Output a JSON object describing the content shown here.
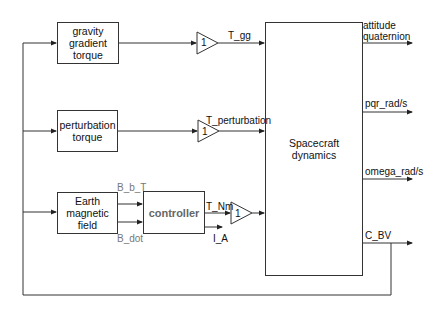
{
  "diagram": {
    "type": "block-diagram",
    "blocks": {
      "gravity": {
        "label": "gravity\ngradient\ntorque"
      },
      "perturbation": {
        "label": "perturbation\ntorque"
      },
      "earth": {
        "label": "Earth\nmagnetic\nfield"
      },
      "controller": {
        "label": "controller"
      },
      "dynamics": {
        "label": "Spacecraft dynamics"
      }
    },
    "gains": [
      {
        "value": "1"
      },
      {
        "value": "1"
      },
      {
        "value": "1"
      }
    ],
    "signals": {
      "t_gg": "T_gg",
      "t_perturbation": "T_perturbation",
      "b_b_t": "B_b_T",
      "b_dot": "B_dot",
      "t_nm": "T_Nm",
      "i_a": "I_A"
    },
    "outputs": [
      {
        "label": "attitude\nquaternion"
      },
      {
        "label": "pqr_rad/s"
      },
      {
        "label": "omega_rad/s"
      },
      {
        "label": "C_BV"
      }
    ],
    "colors": {
      "line": "#333333",
      "controller_text": "#666666"
    }
  }
}
